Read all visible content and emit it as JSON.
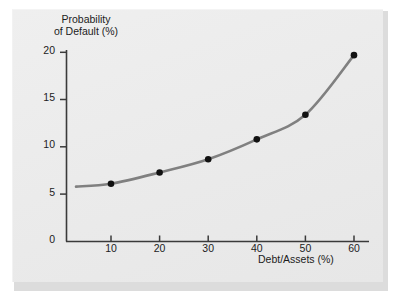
{
  "figure": {
    "panel_color": "#ececec",
    "background_color": "#ffffff"
  },
  "chart_data": {
    "type": "line",
    "title": "",
    "subtitle": "",
    "xlabel": "Debt/Assets (%)",
    "ylabel_lines": [
      "Probability",
      "of Default (%)"
    ],
    "ylabel": "Probability of Default (%)",
    "xlim": [
      2.5,
      62
    ],
    "ylim": [
      0,
      20
    ],
    "xticks": [
      10,
      20,
      30,
      40,
      50,
      60
    ],
    "xtick_labels": [
      "10",
      "20",
      "30",
      "40",
      "50",
      "60"
    ],
    "yticks": [
      0,
      5,
      10,
      15,
      20
    ],
    "ytick_labels": [
      "0",
      "5",
      "10",
      "15",
      "20"
    ],
    "grid": false,
    "legend": false,
    "legend_position": "none",
    "line_color": "#808080",
    "marker_color": "#111111",
    "axis_color": "#3a3a3a",
    "x": [
      10,
      20,
      30,
      40,
      50,
      60
    ],
    "values": [
      6.1,
      7.3,
      8.7,
      10.8,
      13.4,
      19.7
    ],
    "series": [
      {
        "name": "Probability of Default",
        "x": [
          10,
          20,
          30,
          40,
          50,
          60
        ],
        "values": [
          6.1,
          7.3,
          8.7,
          10.8,
          13.4,
          19.7
        ]
      }
    ],
    "curve_start": {
      "x": 2.8,
      "y": 5.8
    },
    "markers_visible": true,
    "annotations": []
  },
  "ticks": {
    "y": [
      "20",
      "15",
      "10",
      "5",
      "0"
    ],
    "x": [
      "10",
      "20",
      "30",
      "40",
      "50",
      "60"
    ]
  },
  "titles": {
    "y_line1": "Probability",
    "y_line2": "of Default (%)",
    "x": "Debt/Assets (%)"
  }
}
